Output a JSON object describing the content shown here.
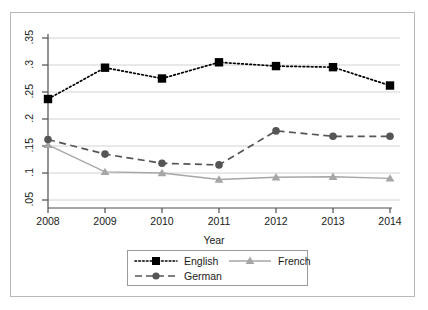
{
  "chart_data": {
    "type": "line",
    "title": "",
    "subtitle": "",
    "xlabel": "Year",
    "ylabel": "",
    "x": [
      2008,
      2009,
      2010,
      2011,
      2012,
      2013,
      2014
    ],
    "categories": [
      "2008",
      "2009",
      "2010",
      "2011",
      "2012",
      "2013",
      "2014"
    ],
    "series": [
      {
        "name": "English",
        "values": [
          0.237,
          0.295,
          0.275,
          0.305,
          0.298,
          0.296,
          0.262
        ],
        "color": "#000000",
        "marker": "square",
        "linestyle": "dotted"
      },
      {
        "name": "German",
        "values": [
          0.162,
          0.135,
          0.118,
          0.115,
          0.178,
          0.168,
          0.168
        ],
        "color": "#555555",
        "marker": "circle",
        "linestyle": "dashed"
      },
      {
        "name": "French",
        "values": [
          0.152,
          0.102,
          0.1,
          0.088,
          0.092,
          0.093,
          0.09
        ],
        "color": "#a6a6a6",
        "marker": "triangle",
        "linestyle": "solid"
      }
    ],
    "xlim": [
      2008,
      2014
    ],
    "ylim": [
      0.05,
      0.35
    ],
    "ytick_labels": [
      ".35",
      ".3",
      ".25",
      ".2",
      ".15",
      ".1",
      ".05"
    ],
    "ytick_values": [
      0.35,
      0.3,
      0.25,
      0.2,
      0.15,
      0.1,
      0.05
    ],
    "xtick_labels": [
      "2008",
      "2009",
      "2010",
      "2011",
      "2012",
      "2013",
      "2014"
    ],
    "grid": "horizontal",
    "legend_position": "bottom-center"
  },
  "legend": {
    "entries": [
      {
        "label": "English"
      },
      {
        "label": "French"
      },
      {
        "label": "German"
      }
    ]
  },
  "colors": {
    "english": "#000000",
    "german": "#555555",
    "french": "#a6a6a6",
    "grid": "#d2d2d2",
    "axis": "#4d4d4d",
    "frame": "#b9b9b9"
  }
}
